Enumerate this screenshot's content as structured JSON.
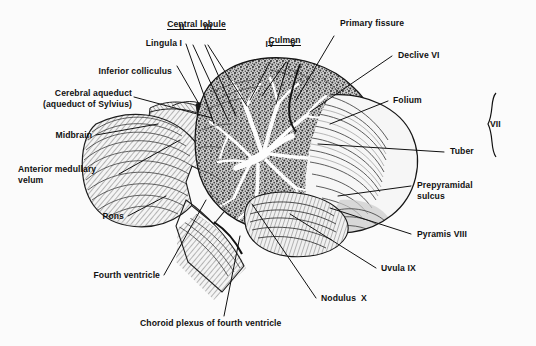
{
  "figure": {
    "background_color": "#fbfbfb",
    "ink_color": "#111111",
    "width": 536,
    "height": 346
  },
  "labels": {
    "central_lobule": "Central lobule",
    "central_lobule_numerals_left": "II",
    "central_lobule_numerals_right": "III",
    "lingula": "Lingula I",
    "inferior_colliculus": "Inferior colliculus",
    "cerebral_aqueduct_line1": "Cerebral aqueduct",
    "cerebral_aqueduct_line2": "(aqueduct of Sylvius)",
    "midbrain": "Midbrain",
    "anterior_medullary_velum_line1": "Anterior medullary",
    "anterior_medullary_velum_line2": "velum",
    "pons": "Pons",
    "fourth_ventricle": "Fourth ventricle",
    "choroid_plexus": "Choroid plexus of fourth ventricle",
    "culmen": "Culmen",
    "culmen_numeral_left": "IV",
    "culmen_numeral_right": "V",
    "primary_fissure": "Primary fissure",
    "declive": "Declive VI",
    "folium": "Folium",
    "tuber": "Tuber",
    "bracket_vii": "VII",
    "prepyramidal_sulcus_line1": "Prepyramidal",
    "prepyramidal_sulcus_line2": "sulcus",
    "pyramis": "Pyramis VIII",
    "uvula": "Uvula IX",
    "nodulus": "Nodulus  X"
  }
}
